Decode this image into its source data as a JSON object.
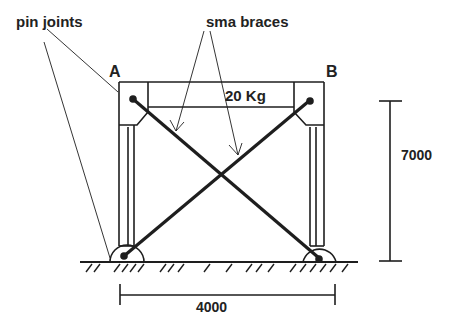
{
  "labels": {
    "pin_joints": "pin joints",
    "sma_braces": "sma braces",
    "node_a": "A",
    "node_b": "B",
    "load": "20 Kg",
    "height_dim": "7000",
    "width_dim": "4000"
  },
  "colors": {
    "line": "#1e1e1e",
    "background": "#ffffff"
  }
}
